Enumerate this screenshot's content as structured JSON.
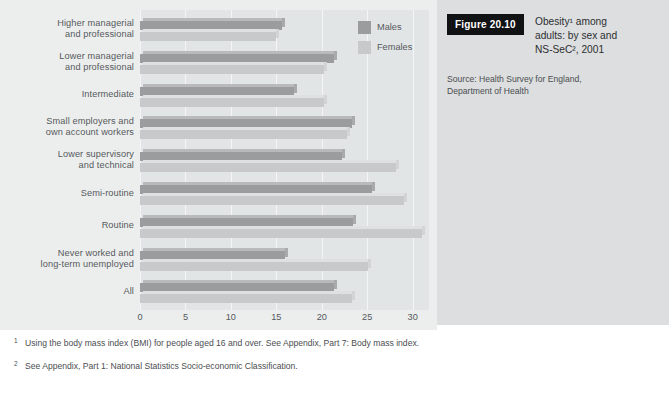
{
  "figure": {
    "badge": "Figure 20.10",
    "title_lines": [
      "Obesity¹ among",
      "adults: by sex and",
      "NS-SeC², 2001"
    ],
    "source_lines": [
      "Source: Health Survey for England,",
      "Department of Health"
    ]
  },
  "footnotes": [
    {
      "marker": "1",
      "text": "Using the body mass index (BMI) for people aged 16 and over. See Appendix, Part 7: Body mass index."
    },
    {
      "marker": "2",
      "text": "See Appendix, Part 1: National Statistics Socio-economic Classification."
    }
  ],
  "legend": {
    "items": [
      {
        "label": "Males",
        "color": "#9b9c9e"
      },
      {
        "label": "Females",
        "color": "#c7c9ca"
      }
    ]
  },
  "chart_data": {
    "type": "bar",
    "orientation": "horizontal",
    "xlabel": "",
    "ylabel": "",
    "xlim": [
      0,
      31.8
    ],
    "xticks": [
      0,
      5,
      10,
      15,
      20,
      25,
      30
    ],
    "xtick_labels": [
      "0",
      "5",
      "10",
      "15",
      "20",
      "25",
      "30"
    ],
    "grid": true,
    "legend_position": "top-right",
    "categories": [
      "Higher managerial and professional",
      "Lower managerial and professional",
      "Intermediate",
      "Small employers and own account workers",
      "Lower supervisory and technical",
      "Semi-routine",
      "Routine",
      "Never worked and long-term unemployed",
      "All"
    ],
    "category_label_lines": [
      [
        "Higher managerial",
        "and professional"
      ],
      [
        "Lower managerial",
        "and professional"
      ],
      [
        "Intermediate"
      ],
      [
        "Small employers and",
        "own account workers"
      ],
      [
        "Lower supervisory",
        "and technical"
      ],
      [
        "Semi-routine"
      ],
      [
        "Routine"
      ],
      [
        "Never worked and",
        "long-term unemployed"
      ],
      [
        "All"
      ]
    ],
    "series": [
      {
        "name": "Males",
        "color": "#9b9c9e",
        "values": [
          15.6,
          21.4,
          17.0,
          23.3,
          22.2,
          25.5,
          23.4,
          15.9,
          21.4
        ]
      },
      {
        "name": "Females",
        "color": "#c7c9ca",
        "values": [
          15.0,
          20.3,
          20.3,
          22.8,
          28.2,
          29.1,
          31.0,
          25.1,
          23.3
        ]
      }
    ]
  }
}
